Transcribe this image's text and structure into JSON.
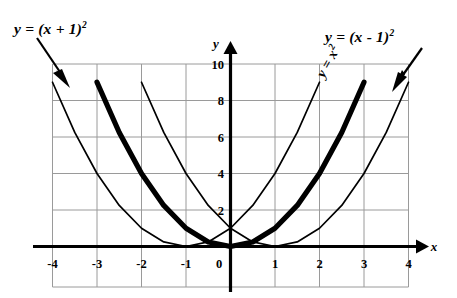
{
  "chart_data": {
    "type": "line",
    "title": "",
    "xlabel": "x",
    "ylabel": "y",
    "xlim": [
      -4.35,
      4.35
    ],
    "ylim": [
      -2,
      10.6
    ],
    "grid": true,
    "grid_x_step": 1,
    "grid_y_step": 2,
    "xticks": [
      "-4",
      "-3",
      "-2",
      "-1",
      "0",
      "1",
      "2",
      "3",
      "4"
    ],
    "xtick_values": [
      -4,
      -3,
      -2,
      -1,
      0,
      1,
      2,
      3,
      4
    ],
    "yticks": [
      "10",
      "8",
      "6",
      "4",
      "2",
      "0"
    ],
    "ytick_values": [
      10,
      8,
      6,
      4,
      2,
      0
    ],
    "legend_position": "annotations",
    "series": [
      {
        "name": "y = (x + 1)²",
        "equation": "y=(x+1)^2",
        "vertex": [
          -1,
          0
        ],
        "y_intercept": 1,
        "style": "thin",
        "x": [
          -4,
          -3.5,
          -3,
          -2.5,
          -2,
          -1.5,
          -1,
          -0.5,
          0,
          0.5,
          1,
          1.5,
          2
        ],
        "values": [
          9,
          6.25,
          4,
          2.25,
          1,
          0.25,
          0,
          0.25,
          1,
          2.25,
          4,
          6.25,
          9
        ]
      },
      {
        "name": "y = x²",
        "equation": "y=x^2",
        "vertex": [
          0,
          0
        ],
        "y_intercept": 0,
        "style": "bold",
        "x": [
          -3,
          -2.5,
          -2,
          -1.5,
          -1,
          -0.5,
          0,
          0.5,
          1,
          1.5,
          2,
          2.5,
          3
        ],
        "values": [
          9,
          6.25,
          4,
          2.25,
          1,
          0.25,
          0,
          0.25,
          1,
          2.25,
          4,
          6.25,
          9
        ]
      },
      {
        "name": "y = (x - 1)²",
        "equation": "y=(x-1)^2",
        "vertex": [
          1,
          0
        ],
        "y_intercept": 1,
        "style": "thin",
        "x": [
          -2,
          -1.5,
          -1,
          -0.5,
          0,
          0.5,
          1,
          1.5,
          2,
          2.5,
          3,
          3.5,
          4
        ],
        "values": [
          9,
          6.25,
          4,
          2.25,
          1,
          0.25,
          0,
          0.25,
          1,
          2.25,
          4,
          6.25,
          9
        ]
      }
    ],
    "annotations": [
      {
        "text": "y = (x + 1)²",
        "target_series": "y = (x + 1)²",
        "placement": "top-left",
        "has_arrow": true
      },
      {
        "text": "y = (x - 1)²",
        "target_series": "y = (x - 1)²",
        "placement": "top-right",
        "has_arrow": true
      },
      {
        "text": "y = x²",
        "target_series": "y = x²",
        "placement": "along-curve",
        "has_arrow": false,
        "rotation_deg": -61
      }
    ]
  },
  "labels": {
    "left_equation_main": "y = (x + 1)",
    "left_equation_exp": "2",
    "right_equation_main": "y = (x - 1)",
    "right_equation_exp": "2",
    "mid_equation_main": "y = x",
    "mid_equation_exp": "2",
    "axis_x": "x",
    "axis_y": "y"
  },
  "colors": {
    "curve": "#000000",
    "axis": "#000000",
    "grid": "#9a9a9a",
    "background": "#ffffff"
  }
}
